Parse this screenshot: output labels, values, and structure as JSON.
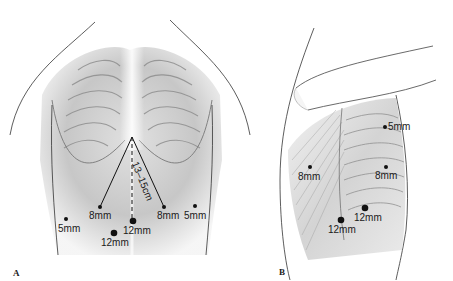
{
  "figure": {
    "panels": [
      {
        "id": "A",
        "letter": "A",
        "view": "anterior abdomen",
        "measurement": "13–15cm",
        "ports": [
          {
            "label": "8mm",
            "position": "left upper"
          },
          {
            "label": "8mm",
            "position": "right upper"
          },
          {
            "label": "5mm",
            "position": "left lateral"
          },
          {
            "label": "5mm",
            "position": "right lateral"
          },
          {
            "label": "12mm",
            "position": "midline umbilical"
          },
          {
            "label": "12mm",
            "position": "left paramedian"
          }
        ]
      },
      {
        "id": "B",
        "letter": "B",
        "view": "lateral flank",
        "ports": [
          {
            "label": "5mm",
            "position": "upper"
          },
          {
            "label": "8mm",
            "position": "posterior"
          },
          {
            "label": "8mm",
            "position": "anterior"
          },
          {
            "label": "12mm",
            "position": "lower anterior"
          },
          {
            "label": "12mm",
            "position": "lower posterior"
          }
        ]
      }
    ]
  },
  "colors": {
    "ink": "#1a1a1a",
    "skin_shadow": "#9a9a9a",
    "background": "#ffffff"
  }
}
